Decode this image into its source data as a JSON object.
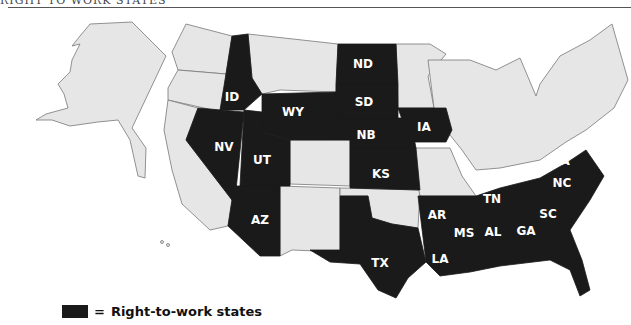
{
  "header": {
    "title_partial": "RIGHT TO WORK STATES"
  },
  "legend": {
    "equals": "=",
    "label": "Right-to-work states",
    "swatch_color": "#1a1a1a"
  },
  "colors": {
    "right_to_work": "#1a1a1a",
    "other": "#e6e6e6",
    "border": "#777777"
  },
  "map": {
    "right_to_work_states": [
      "ID",
      "WY",
      "ND",
      "SD",
      "NB",
      "IA",
      "NV",
      "UT",
      "AZ",
      "KS",
      "TX",
      "AR",
      "LA",
      "MS",
      "AL",
      "TN",
      "GA",
      "SC",
      "NC",
      "VA",
      "FL"
    ],
    "labels": {
      "ID": "ID",
      "WY": "WY",
      "ND": "ND",
      "SD": "SD",
      "NB": "NB",
      "IA": "IA",
      "NV": "NV",
      "UT": "UT",
      "AZ": "AZ",
      "KS": "KS",
      "TX": "TX",
      "AR": "AR",
      "LA": "LA",
      "MS": "MS",
      "AL": "AL",
      "TN": "TN",
      "GA": "GA",
      "SC": "SC",
      "NC": "NC",
      "VA": "VA",
      "FL": "FL"
    }
  }
}
